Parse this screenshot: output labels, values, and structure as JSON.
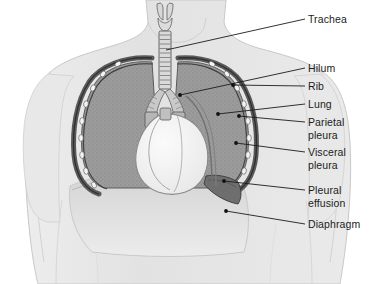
{
  "figure": {
    "colors": {
      "background": "#ffffff",
      "body_silhouette": "#e2e2e2",
      "body_outline": "#c2c2c2",
      "lung_fill": "#9c9c9c",
      "lung_stipple": "#8a8a8a",
      "pleura_band": "#6f6f6f",
      "pleura_line": "#3a3a3a",
      "rib_marker": "#f2f2f2",
      "heart_fill": "#f4f4f4",
      "heart_outline": "#8d8d8d",
      "trachea_fill": "#d8d8d8",
      "trachea_outline": "#6a6a6a",
      "effusion_fill": "#6a6a6a",
      "diaphragm_fill": "#d6d6d6",
      "leader_line": "#1c1c1c",
      "leader_dot": "#111111",
      "label_text": "#1c1c1c"
    },
    "labels": [
      {
        "id": "trachea",
        "text": "Trachea",
        "text_x": 308,
        "text_y": 13,
        "leader": {
          "x1": 305,
          "y1": 19,
          "x2": 166,
          "y2": 50
        },
        "dot": {
          "x": 166,
          "y": 50,
          "show": false
        }
      },
      {
        "id": "hilum",
        "text": "Hilum",
        "text_x": 308,
        "text_y": 62,
        "leader": {
          "x1": 305,
          "y1": 68,
          "x2": 180,
          "y2": 95
        },
        "dot": {
          "x": 180,
          "y": 95,
          "show": true
        }
      },
      {
        "id": "rib",
        "text": "Rib",
        "text_x": 308,
        "text_y": 80,
        "leader": {
          "x1": 305,
          "y1": 86,
          "x2": 233,
          "y2": 85
        },
        "dot": {
          "x": 233,
          "y": 85,
          "show": true
        }
      },
      {
        "id": "lung",
        "text": "Lung",
        "text_x": 308,
        "text_y": 98,
        "leader": {
          "x1": 305,
          "y1": 104,
          "x2": 218,
          "y2": 114
        },
        "dot": {
          "x": 218,
          "y": 114,
          "show": true
        }
      },
      {
        "id": "parietal-pleura",
        "text": "Parietal\npleura",
        "text_x": 308,
        "text_y": 116,
        "leader": {
          "x1": 305,
          "y1": 122,
          "x2": 239,
          "y2": 116
        },
        "dot": {
          "x": 239,
          "y": 116,
          "show": true
        }
      },
      {
        "id": "visceral-pleura",
        "text": "Visceral\npleura",
        "text_x": 308,
        "text_y": 146,
        "leader": {
          "x1": 305,
          "y1": 152,
          "x2": 236,
          "y2": 143
        },
        "dot": {
          "x": 236,
          "y": 143,
          "show": true
        }
      },
      {
        "id": "pleural-effusion",
        "text": "Pleural\neffusion",
        "text_x": 308,
        "text_y": 184,
        "leader": {
          "x1": 305,
          "y1": 190,
          "x2": 224,
          "y2": 181
        },
        "dot": {
          "x": 224,
          "y": 181,
          "show": true
        }
      },
      {
        "id": "diaphragm",
        "text": "Diaphragm",
        "text_x": 308,
        "text_y": 218,
        "leader": {
          "x1": 305,
          "y1": 224,
          "x2": 226,
          "y2": 211
        },
        "dot": {
          "x": 226,
          "y": 211,
          "show": true
        }
      }
    ],
    "structures": {
      "larynx": "larynx-cartilage",
      "trachea_rings": 13,
      "left_lung": "left-lung-field",
      "right_lung": "right-lung-field",
      "heart": "heart-silhouette",
      "diaphragm": "diaphragm-dome",
      "effusion": "pleural-effusion-crescent",
      "rib_count_per_side": 9
    }
  }
}
